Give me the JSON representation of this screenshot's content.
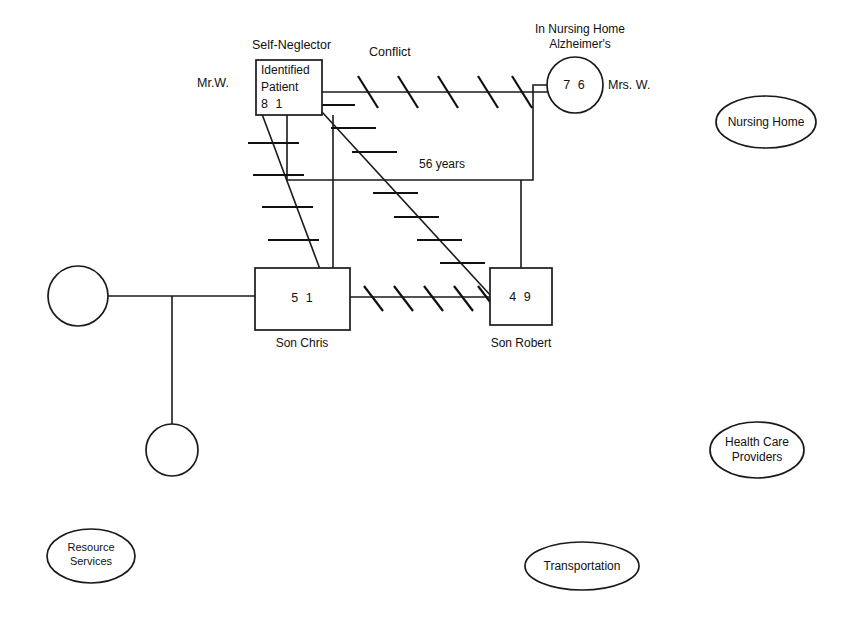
{
  "diagram": {
    "type": "genogram-ecomap",
    "title_visible": false
  },
  "people": {
    "identified_patient": {
      "shape": "square",
      "line1": "Identified",
      "line2": "Patient",
      "age": "8 1",
      "top_label": "Self-Neglector",
      "left_label": "Mr.W."
    },
    "wife": {
      "shape": "circle",
      "age": "7 6",
      "right_label": "Mrs. W.",
      "top_label_line1": "In Nursing Home",
      "top_label_line2": "Alzheimer's"
    },
    "son_chris": {
      "shape": "square",
      "age": "5 1",
      "bottom_label": "Son Chris"
    },
    "son_robert": {
      "shape": "square",
      "age": "4 9",
      "bottom_label": "Son Robert"
    },
    "chris_spouse": {
      "shape": "circle",
      "age": "",
      "label": ""
    },
    "chris_child": {
      "shape": "circle",
      "age": "",
      "label": ""
    }
  },
  "relationships": {
    "conflict_label": "Conflict",
    "marriage_duration": "56 years",
    "conflict_lines": [
      {
        "from": "identified_patient",
        "to": "wife",
        "hatches": 5
      },
      {
        "from": "identified_patient",
        "to": "son_chris",
        "hatches": 4
      },
      {
        "from": "identified_patient",
        "to": "son_robert",
        "hatches": 7
      },
      {
        "from": "son_chris",
        "to": "son_robert",
        "hatches": 5
      }
    ]
  },
  "ecomap_resources": [
    {
      "id": "nursing-home",
      "label": "Nursing Home",
      "lines": [
        "Nursing Home"
      ]
    },
    {
      "id": "health-care-providers",
      "label": "Health Care Providers",
      "lines": [
        "Health Care",
        "Providers"
      ]
    },
    {
      "id": "resource-services",
      "label": "Resource Services",
      "lines": [
        "Resource",
        "Services"
      ]
    },
    {
      "id": "transportation",
      "label": "Transportation",
      "lines": [
        "Transportation"
      ]
    }
  ],
  "colors": {
    "stroke": "#1a1a1a",
    "background": "#ffffff",
    "text": "#111111"
  }
}
